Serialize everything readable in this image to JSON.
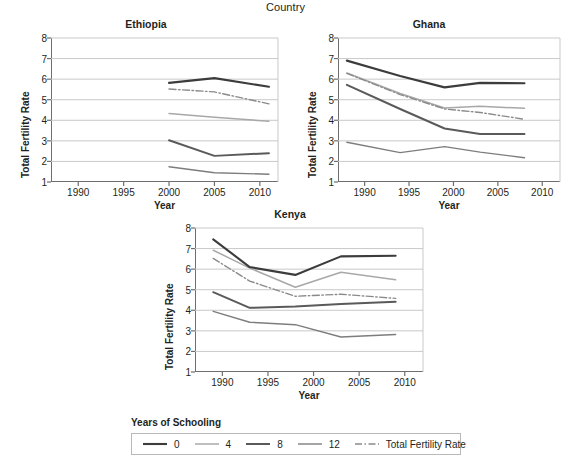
{
  "header": {
    "title": "Country"
  },
  "axis": {
    "ylabel": "Total Fertility Rate",
    "xlabel": "Year"
  },
  "legend": {
    "heading": "Years of Schooling",
    "items": [
      {
        "label": "0",
        "color": "#3c3c3c",
        "width": 2.1,
        "dash": "none"
      },
      {
        "label": "4",
        "color": "#a8a8a8",
        "width": 1.5,
        "dash": "none"
      },
      {
        "label": "8",
        "color": "#5a5a5a",
        "width": 2.0,
        "dash": "none"
      },
      {
        "label": "12",
        "color": "#7d7d7d",
        "width": 1.4,
        "dash": "none"
      },
      {
        "label": "Total Fertility Rate",
        "color": "#8a8a8a",
        "width": 1.4,
        "dash": "dashdot"
      }
    ]
  },
  "chart_data": [
    {
      "type": "line",
      "title": "Ethiopia",
      "xlabel": "Year",
      "ylabel": "Total Fertility Rate",
      "xlim": [
        1987,
        2012
      ],
      "ylim": [
        1,
        8
      ],
      "xticks": [
        1990,
        1995,
        2000,
        2005,
        2010
      ],
      "yticks": [
        1,
        2,
        3,
        4,
        5,
        6,
        7,
        8
      ],
      "grid": "horizontal",
      "series": [
        {
          "name": "0",
          "x": [
            2000,
            2005,
            2011
          ],
          "y": [
            5.82,
            6.05,
            5.63
          ]
        },
        {
          "name": "4",
          "x": [
            2000,
            2005,
            2011
          ],
          "y": [
            4.33,
            4.15,
            3.95
          ]
        },
        {
          "name": "8",
          "x": [
            2000,
            2005,
            2011
          ],
          "y": [
            3.03,
            2.27,
            2.4
          ]
        },
        {
          "name": "12",
          "x": [
            2000,
            2005,
            2011
          ],
          "y": [
            1.74,
            1.45,
            1.38
          ]
        },
        {
          "name": "Total Fertility Rate",
          "x": [
            2000,
            2005,
            2011
          ],
          "y": [
            5.52,
            5.38,
            4.8
          ]
        }
      ]
    },
    {
      "type": "line",
      "title": "Ghana",
      "xlabel": "Year",
      "ylabel": "Total Fertility Rate",
      "xlim": [
        1987,
        2012
      ],
      "ylim": [
        1,
        8
      ],
      "xticks": [
        1990,
        1995,
        2000,
        2005,
        2010
      ],
      "yticks": [
        1,
        2,
        3,
        4,
        5,
        6,
        7,
        8
      ],
      "grid": "horizontal",
      "series": [
        {
          "name": "0",
          "x": [
            1988,
            1994,
            1999,
            2003,
            2008
          ],
          "y": [
            6.9,
            6.15,
            5.6,
            5.82,
            5.8
          ]
        },
        {
          "name": "4",
          "x": [
            1988,
            1994,
            1999,
            2003,
            2008
          ],
          "y": [
            6.3,
            5.3,
            4.6,
            4.68,
            4.58
          ]
        },
        {
          "name": "8",
          "x": [
            1988,
            1994,
            1999,
            2003,
            2008
          ],
          "y": [
            5.72,
            4.55,
            3.6,
            3.33,
            3.33
          ]
        },
        {
          "name": "12",
          "x": [
            1988,
            1994,
            1999,
            2003,
            2008
          ],
          "y": [
            2.93,
            2.43,
            2.72,
            2.45,
            2.18
          ]
        },
        {
          "name": "Total Fertility Rate",
          "x": [
            1988,
            1994,
            1999,
            2003,
            2008
          ],
          "y": [
            6.28,
            5.25,
            4.55,
            4.38,
            4.05
          ]
        }
      ]
    },
    {
      "type": "line",
      "title": "Kenya",
      "xlabel": "Year",
      "ylabel": "Total Fertility Rate",
      "xlim": [
        1987,
        2012
      ],
      "ylim": [
        1,
        8
      ],
      "xticks": [
        1990,
        1995,
        2000,
        2005,
        2010
      ],
      "yticks": [
        1,
        2,
        3,
        4,
        5,
        6,
        7,
        8
      ],
      "grid": "horizontal",
      "series": [
        {
          "name": "0",
          "x": [
            1989,
            1993,
            1998,
            2003,
            2009
          ],
          "y": [
            7.45,
            6.1,
            5.72,
            6.62,
            6.65
          ]
        },
        {
          "name": "4",
          "x": [
            1989,
            1993,
            1998,
            2003,
            2009
          ],
          "y": [
            6.92,
            6.05,
            5.12,
            5.85,
            5.48
          ]
        },
        {
          "name": "8",
          "x": [
            1989,
            1993,
            1998,
            2003,
            2009
          ],
          "y": [
            4.88,
            4.12,
            4.18,
            4.3,
            4.42
          ]
        },
        {
          "name": "12",
          "x": [
            1989,
            1993,
            1998,
            2003,
            2009
          ],
          "y": [
            3.95,
            3.42,
            3.3,
            2.7,
            2.82
          ]
        },
        {
          "name": "Total Fertility Rate",
          "x": [
            1989,
            1993,
            1998,
            2003,
            2009
          ],
          "y": [
            6.52,
            5.42,
            4.68,
            4.78,
            4.58
          ]
        }
      ]
    }
  ]
}
